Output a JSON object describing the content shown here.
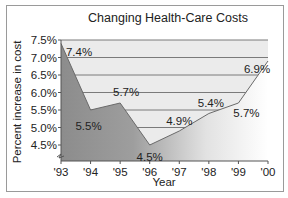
{
  "chart_data": {
    "type": "area",
    "title": "Changing Health-Care Costs",
    "xlabel": "Year",
    "ylabel": "Percent increase in cost",
    "categories": [
      "'93",
      "'94",
      "'95",
      "'96",
      "'97",
      "'98",
      "'99",
      "'00"
    ],
    "values": [
      7.4,
      5.5,
      5.7,
      4.5,
      4.9,
      5.4,
      5.7,
      6.9
    ],
    "data_labels": [
      "7.4%",
      "5.5%",
      "5.7%",
      "4.5%",
      "4.9%",
      "5.4%",
      "5.7%",
      "6.9%"
    ],
    "yticks": [
      "7.5%",
      "7.0%",
      "6.5%",
      "6.0%",
      "5.5%",
      "5.0%",
      "4.5%"
    ],
    "ytick_values": [
      7.5,
      7.0,
      6.5,
      6.0,
      5.5,
      5.0,
      4.5
    ],
    "ylim": [
      4.0,
      7.5
    ],
    "grid": true,
    "axis_break": true,
    "legend": null
  },
  "colors": {
    "upper_fill": "#ebebeb",
    "gridline": "#7a7a7a",
    "area_left": "#8c8c8c",
    "area_right": "#ffffff",
    "line": "#6a6a6a",
    "frame": "#9a9a9a"
  }
}
